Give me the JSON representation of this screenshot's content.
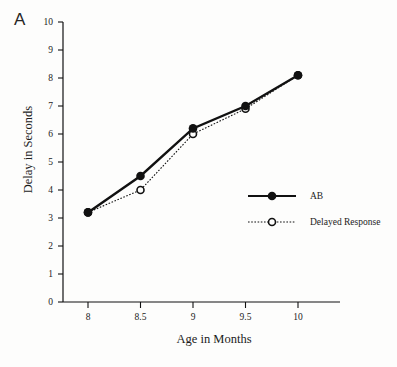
{
  "figure": {
    "panel_label": "A",
    "background_color": "#fdfdfc",
    "ink_color": "#111111"
  },
  "chart_data": {
    "type": "line",
    "title": "",
    "subtitle": "",
    "panel": "A",
    "xlabel": "Age in Months",
    "ylabel": "Delay in Seconds",
    "x": [
      8,
      8.5,
      9,
      9.5,
      10
    ],
    "xticklabels": [
      "8",
      "8.5",
      "9",
      "9.5",
      "10"
    ],
    "xlim": [
      7.75,
      10.45
    ],
    "ylim": [
      0,
      10
    ],
    "yticks": [
      0,
      1,
      2,
      3,
      4,
      5,
      6,
      7,
      8,
      9,
      10
    ],
    "yticklabels": [
      "0",
      "1",
      "2",
      "3",
      "4",
      "5",
      "6",
      "7",
      "8",
      "9",
      "10"
    ],
    "grid": false,
    "legend_position": "center-right",
    "series": [
      {
        "name": "AB",
        "values": [
          3.2,
          4.5,
          6.2,
          7.0,
          8.1
        ],
        "line_style": "solid",
        "marker": "filled-circle",
        "color": "#111111"
      },
      {
        "name": "Delayed Response",
        "values": [
          3.2,
          4.0,
          6.0,
          6.9,
          8.1
        ],
        "line_style": "dotted",
        "marker": "open-circle",
        "color": "#111111"
      }
    ],
    "legend": [
      {
        "label": "AB",
        "line_style": "solid",
        "marker": "filled-circle"
      },
      {
        "label": "Delayed Response",
        "line_style": "dotted",
        "marker": "open-circle"
      }
    ]
  }
}
